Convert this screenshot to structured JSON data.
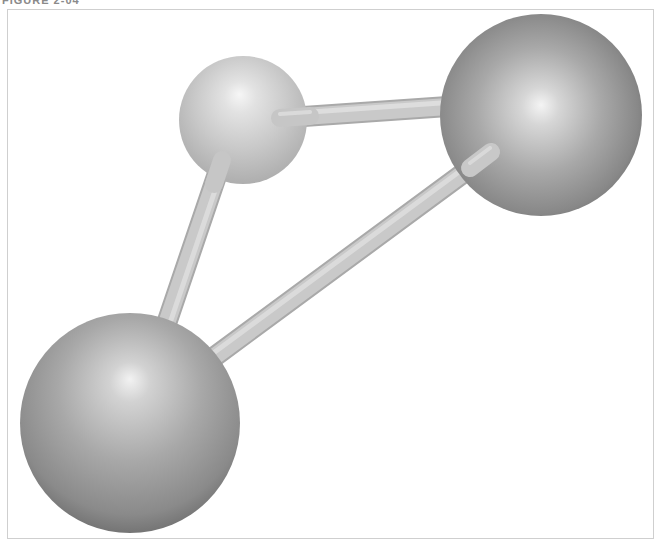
{
  "caption": {
    "text": "FIGURE 2-04",
    "clipped": true
  },
  "figure": {
    "type": "ball-and-stick molecular model",
    "atoms": [
      {
        "id": "small-atom",
        "label": "small light sphere",
        "cx": 243,
        "cy": 120,
        "r": 64,
        "base_color": "#c4c4c4",
        "highlight_color": "#f4f4f4",
        "edge_color": "#a8a8a8"
      },
      {
        "id": "large-atom-top-right",
        "label": "large dark sphere (top right)",
        "cx": 541,
        "cy": 115,
        "r": 101,
        "base_color": "#9a9a9a",
        "highlight_color": "#f2f2f2",
        "edge_color": "#646464"
      },
      {
        "id": "large-atom-bottom-left",
        "label": "large dark sphere (bottom left)",
        "cx": 130,
        "cy": 423,
        "r": 110,
        "base_color": "#9a9a9a",
        "highlight_color": "#f2f2f2",
        "edge_color": "#646464"
      }
    ],
    "bonds": [
      {
        "id": "bond-small-to-top-right",
        "from": "small-atom",
        "to": "large-atom-top-right",
        "x1": 282,
        "y1": 118,
        "x2": 455,
        "y2": 106,
        "width": 20
      },
      {
        "id": "bond-small-to-bottom-left",
        "from": "small-atom",
        "to": "large-atom-bottom-left",
        "x1": 222,
        "y1": 160,
        "x2": 166,
        "y2": 325,
        "width": 20
      },
      {
        "id": "bond-top-right-to-bottom-left",
        "from": "large-atom-top-right",
        "to": "large-atom-bottom-left",
        "x1": 492,
        "y1": 152,
        "x2": 210,
        "y2": 360,
        "width": 20
      }
    ],
    "bond_color": "#c9c9c9",
    "bond_highlight": "#e2e2e2",
    "bond_shadow": "#a9a9a9"
  },
  "colors": {
    "background": "#ffffff",
    "frame_border": "#cfcfcf",
    "caption": "#8a8a8a"
  }
}
